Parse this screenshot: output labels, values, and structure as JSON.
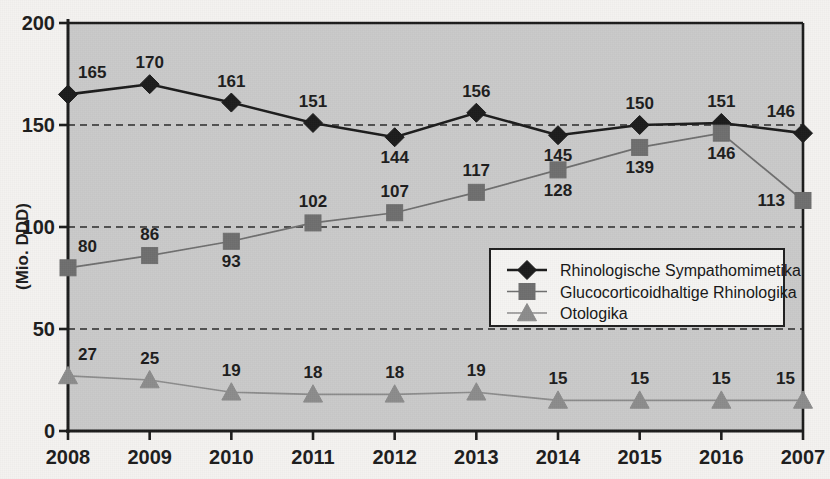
{
  "chart_data": {
    "type": "line",
    "title": "",
    "subtitle": "",
    "xlabel": "",
    "ylabel": "(Mio. DDD)",
    "categories": [
      "2008",
      "2009",
      "2010",
      "2011",
      "2012",
      "2013",
      "2014",
      "2015",
      "2016",
      "2007"
    ],
    "ylim": [
      0,
      200
    ],
    "yticks": [
      "0",
      "50",
      "100",
      "150",
      "200"
    ],
    "ytick_values": [
      0,
      50,
      100,
      150,
      200
    ],
    "grid": "horizontal dashed gridlines at 50, 100, 150, 200",
    "legend_position": "inside right-center",
    "series": [
      {
        "name": "Rhinologische Sympathomimetika",
        "marker": "diamond",
        "color": "#1b1b1b",
        "values": [
          165,
          170,
          161,
          151,
          144,
          156,
          145,
          150,
          151,
          146
        ],
        "label_positions": [
          "above",
          "above",
          "above",
          "above",
          "below",
          "above",
          "below",
          "above",
          "above",
          "above"
        ]
      },
      {
        "name": "Glucocorticoidhaltige Rhinologika",
        "marker": "square",
        "color": "#6e6e6e",
        "values": [
          80,
          86,
          93,
          102,
          107,
          117,
          128,
          139,
          146,
          113
        ],
        "label_positions": [
          "above",
          "above",
          "below",
          "above",
          "above",
          "above",
          "below",
          "below",
          "below",
          "left"
        ]
      },
      {
        "name": "Otologika",
        "marker": "triangle",
        "color": "#8c8c8c",
        "values": [
          27,
          25,
          19,
          18,
          18,
          19,
          15,
          15,
          15,
          15
        ],
        "label_positions": [
          "above",
          "above",
          "above",
          "above",
          "above",
          "above",
          "above",
          "above",
          "above",
          "above"
        ]
      }
    ]
  },
  "colors": {
    "plot_background": "#c9c9c9",
    "page_background": "#f4f2f0",
    "axis": "#1b1b1b",
    "gridline": "#2a2a2a",
    "series_1": "#1b1b1b",
    "series_2": "#6e6e6e",
    "series_3": "#8c8c8c",
    "legend_background": "#f5f4f2",
    "legend_border": "#1f1f1f"
  },
  "legend": {
    "items": [
      {
        "label": "Rhinologische Sympathomimetika",
        "marker": "diamond-marker",
        "color": "#1b1b1b"
      },
      {
        "label": "Glucocorticoidhaltige Rhinologika",
        "marker": "square-marker",
        "color": "#6e6e6e"
      },
      {
        "label": "Otologika",
        "marker": "triangle-marker",
        "color": "#8c8c8c"
      }
    ]
  }
}
